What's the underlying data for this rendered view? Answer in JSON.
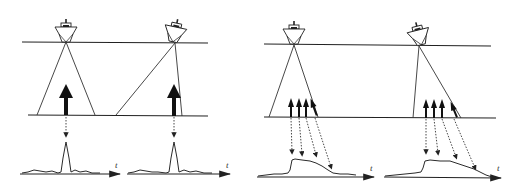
{
  "figure": {
    "colors": {
      "ink": "#222222",
      "background": "#ffffff"
    },
    "panels": [
      {
        "id": "narrow-vertical",
        "axis_label": "t",
        "beam": "narrow",
        "ship_tilt": "level"
      },
      {
        "id": "narrow-tilted",
        "axis_label": "t",
        "beam": "narrow",
        "ship_tilt": "rolled"
      },
      {
        "id": "wide-vertical",
        "axis_label": "t",
        "beam": "wide",
        "ship_tilt": "level"
      },
      {
        "id": "wide-tilted",
        "axis_label": "t",
        "beam": "wide",
        "ship_tilt": "rolled"
      }
    ]
  }
}
